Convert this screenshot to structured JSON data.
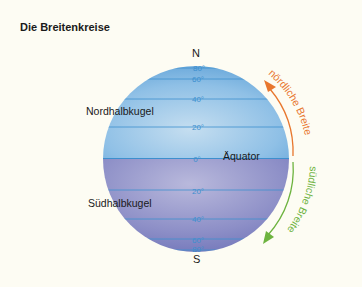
{
  "title": "Die Breitenkreise",
  "poles": {
    "north": "N",
    "south": "S"
  },
  "hemispheres": {
    "north": "Nordhalbkugel",
    "south": "Südhalbkugel"
  },
  "equator_label": "Äquator",
  "latitudes": {
    "n80": "80°",
    "n60": "60°",
    "n40": "40°",
    "n20": "20°",
    "eq": "0°",
    "s20": "20°",
    "s40": "40°",
    "s60": "60°",
    "s80": "80°"
  },
  "arcs": {
    "north": {
      "label": "nördliche Breite",
      "color": "#e8772e"
    },
    "south": {
      "label": "südliche Breite",
      "color": "#6db33f"
    }
  },
  "colors": {
    "background": "#fdfcf3",
    "north_globe": "#8cc4ea",
    "south_globe": "#8c8cc4",
    "latitude_line": "#3d8fce"
  }
}
